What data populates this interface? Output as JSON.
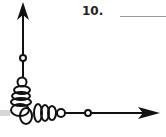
{
  "question": {
    "number": "10.",
    "answer_blank": ""
  },
  "diagram": {
    "type": "angle",
    "rays": [
      "up",
      "right"
    ],
    "stroke_color": "#111111"
  }
}
